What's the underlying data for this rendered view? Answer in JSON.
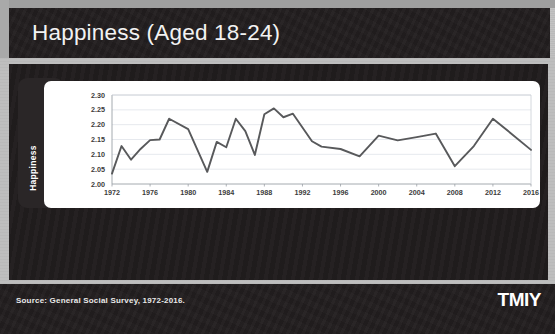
{
  "slide": {
    "title": "Happiness (Aged 18-24)",
    "source_text": "Source: General Social Survey, 1972-2016.",
    "logo_text": "TMIY",
    "colors": {
      "title_bar": "#231f20",
      "panel": "#211d1e",
      "card": "#ffffff",
      "line": "#58595b",
      "background": "#bdbdbd"
    }
  },
  "chart_data": {
    "type": "line",
    "title": "Happiness (Aged 18-24)",
    "xlabel": "",
    "ylabel": "Happiness",
    "ylim": [
      2.0,
      2.3
    ],
    "xlim": [
      1972,
      2016
    ],
    "ytick_labels": [
      "2.00",
      "2.05",
      "2.10",
      "2.15",
      "2.20",
      "2.25",
      "2.30"
    ],
    "ytick_values": [
      2.0,
      2.05,
      2.1,
      2.15,
      2.2,
      2.25,
      2.3
    ],
    "xtick_labels": [
      "1972",
      "1976",
      "1980",
      "1984",
      "1988",
      "1992",
      "1996",
      "2000",
      "2004",
      "2008",
      "2012",
      "2016"
    ],
    "xtick_values": [
      1972,
      1976,
      1980,
      1984,
      1988,
      1992,
      1996,
      2000,
      2004,
      2008,
      2012,
      2016
    ],
    "grid": "horizontal",
    "legend": "none",
    "series": [
      {
        "name": "Happiness",
        "color": "#58595b",
        "x": [
          1972,
          1973,
          1974,
          1975,
          1976,
          1977,
          1978,
          1980,
          1982,
          1983,
          1984,
          1985,
          1986,
          1987,
          1988,
          1989,
          1990,
          1991,
          1993,
          1994,
          1996,
          1998,
          2000,
          2002,
          2004,
          2006,
          2008,
          2010,
          2012,
          2014,
          2016
        ],
        "y": [
          2.035,
          2.128,
          2.082,
          2.118,
          2.148,
          2.15,
          2.22,
          2.185,
          2.041,
          2.142,
          2.124,
          2.22,
          2.178,
          2.098,
          2.235,
          2.255,
          2.225,
          2.237,
          2.144,
          2.126,
          2.118,
          2.093,
          2.163,
          2.147,
          2.158,
          2.17,
          2.06,
          2.128,
          2.22,
          2.168,
          2.115
        ]
      }
    ]
  }
}
